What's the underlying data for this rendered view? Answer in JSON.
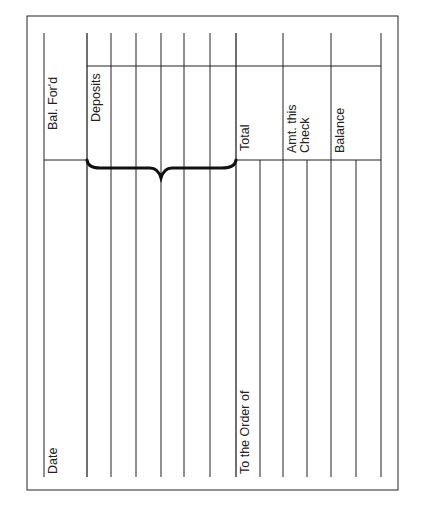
{
  "form": {
    "title": "Check register stub (rotated)",
    "labels": {
      "bal_ford": "Bal. For'd",
      "deposits": "Deposits",
      "total": "Total",
      "amt_this_check_line1": "Amt. this",
      "amt_this_check_line2": "Check",
      "balance": "Balance",
      "date": "Date",
      "to_the_order_of": "To the Order of"
    },
    "colors": {
      "line": "#222222",
      "background": "#ffffff"
    }
  }
}
